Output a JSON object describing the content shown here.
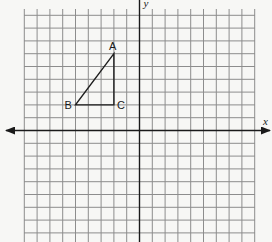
{
  "diagram": {
    "type": "coordinate-plane",
    "grid": {
      "x_min": -9,
      "x_max": 9,
      "y_min": -9,
      "y_max": 9,
      "origin_px": [
        139.5,
        130.5
      ],
      "unit_px": 12.8,
      "grid_left_px": 24,
      "grid_top_px": 9,
      "grid_right_px": 255,
      "grid_bottom_px": 242
    },
    "axes": {
      "x_label": "x",
      "y_label": "y"
    },
    "triangle": {
      "vertices": [
        {
          "name": "A",
          "x": -2,
          "y": 6
        },
        {
          "name": "B",
          "x": -5,
          "y": 2
        },
        {
          "name": "C",
          "x": -2,
          "y": 2
        }
      ]
    },
    "colors": {
      "grid": "#8d8d8d",
      "axis": "#1a1a1a",
      "background": "#f7f7f5"
    }
  }
}
